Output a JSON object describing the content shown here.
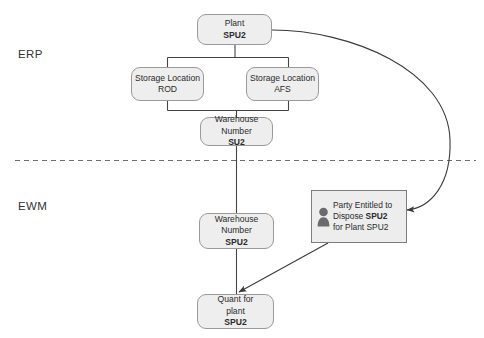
{
  "diagram": {
    "zones": [
      {
        "id": "erp",
        "label": "ERP"
      },
      {
        "id": "ewm",
        "label": "EWM"
      }
    ],
    "divider": {
      "style": "dashed",
      "color": "#6f6f6f"
    },
    "colors": {
      "node_fill": "#eeeeee",
      "node_border": "#9a9a9a",
      "party_fill": "#ededed",
      "party_border": "#7d7d7d",
      "connector": "#444444",
      "icon": "#6b6b6b",
      "text": "#2b2b2b"
    },
    "nodes": [
      {
        "id": "plant",
        "zone": "erp",
        "shape": "rounded-rect",
        "lines": [
          {
            "plain": "Plant ",
            "bold": "SPU2"
          }
        ]
      },
      {
        "id": "storage-location-rod",
        "zone": "erp",
        "shape": "rounded-rect",
        "lines": [
          {
            "plain": "Storage Location",
            "bold": ""
          },
          {
            "plain": "ROD",
            "bold": ""
          }
        ]
      },
      {
        "id": "storage-location-afs",
        "zone": "erp",
        "shape": "rounded-rect",
        "lines": [
          {
            "plain": "Storage Location",
            "bold": ""
          },
          {
            "plain": "AFS",
            "bold": ""
          }
        ]
      },
      {
        "id": "warehouse-number-su2",
        "zone": "erp",
        "shape": "rounded-rect",
        "lines": [
          {
            "plain": "Warehouse",
            "bold": ""
          },
          {
            "plain": "Number ",
            "bold": "SU2"
          }
        ]
      },
      {
        "id": "warehouse-number-spu2",
        "zone": "ewm",
        "shape": "rounded-rect",
        "lines": [
          {
            "plain": "Warehouse",
            "bold": ""
          },
          {
            "plain": "Number ",
            "bold": "SPU2"
          }
        ]
      },
      {
        "id": "quant-for-plant-spu2",
        "zone": "ewm",
        "shape": "rounded-rect",
        "lines": [
          {
            "plain": "Quant for",
            "bold": ""
          },
          {
            "plain": "plant ",
            "bold": "SPU2"
          }
        ]
      },
      {
        "id": "party-entitled-to-dispose",
        "zone": "ewm",
        "shape": "rect",
        "icon": "person-icon",
        "lines": [
          {
            "plain": "Party Entitled to",
            "bold": ""
          },
          {
            "plain": "Dispose ",
            "bold": "SPU2"
          },
          {
            "plain": "for Plant SPU2",
            "bold": ""
          }
        ]
      }
    ],
    "edges": [
      {
        "id": "plant-to-storage-locations",
        "from": "plant",
        "to": "storage-location-rod,storage-location-afs",
        "type": "tree",
        "arrow": false
      },
      {
        "id": "storage-locations-to-warehouse-su2",
        "from": "storage-location-rod,storage-location-afs",
        "to": "warehouse-number-su2",
        "type": "tree",
        "arrow": false
      },
      {
        "id": "warehouse-su2-to-warehouse-spu2",
        "from": "warehouse-number-su2",
        "to": "warehouse-number-spu2",
        "type": "straight",
        "arrow": false
      },
      {
        "id": "warehouse-spu2-to-quant",
        "from": "warehouse-number-spu2",
        "to": "quant-for-plant-spu2",
        "type": "straight",
        "arrow": false
      },
      {
        "id": "plant-to-party-entitled",
        "from": "plant",
        "to": "party-entitled-to-dispose",
        "type": "curved",
        "arrow": true
      },
      {
        "id": "party-entitled-to-quant",
        "from": "party-entitled-to-dispose",
        "to": "quant-for-plant-spu2",
        "type": "diagonal",
        "arrow": true
      }
    ]
  }
}
